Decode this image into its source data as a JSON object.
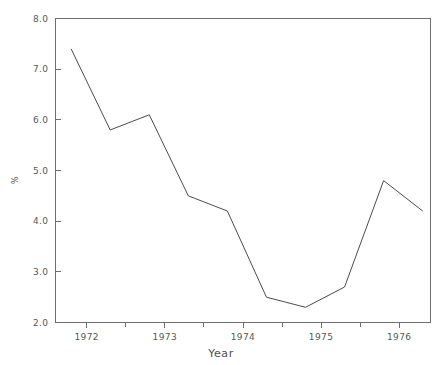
{
  "chart_data": {
    "type": "line",
    "title": "",
    "subtitle": "",
    "xlabel": "Year",
    "ylabel": "%",
    "xlim": [
      1971.6,
      1976.4
    ],
    "ylim": [
      2.0,
      8.0
    ],
    "grid": false,
    "legend": null,
    "x_tick_labels": [
      "1972",
      "1973",
      "1974",
      "1975",
      "1976"
    ],
    "x_tick_values": [
      1972,
      1973,
      1974,
      1975,
      1976
    ],
    "y_tick_labels": [
      "2.0",
      "3.0",
      "4.0",
      "5.0",
      "6.0",
      "7.0",
      "8.0"
    ],
    "y_tick_values": [
      2.0,
      3.0,
      4.0,
      5.0,
      6.0,
      7.0,
      8.0
    ],
    "series": [
      {
        "name": "",
        "color": "#4c4c4c",
        "x": [
          1971.8,
          1972.3,
          1972.8,
          1973.3,
          1973.8,
          1974.3,
          1974.8,
          1975.3,
          1975.8,
          1976.3
        ],
        "values": [
          7.4,
          5.8,
          6.1,
          4.5,
          4.2,
          2.5,
          2.3,
          2.7,
          4.8,
          4.2
        ]
      }
    ],
    "axis_color": "#6f6f6f",
    "line_color": "#4c4c4c",
    "background": "#ffffff"
  },
  "figure": {
    "width": 443,
    "height": 365
  }
}
